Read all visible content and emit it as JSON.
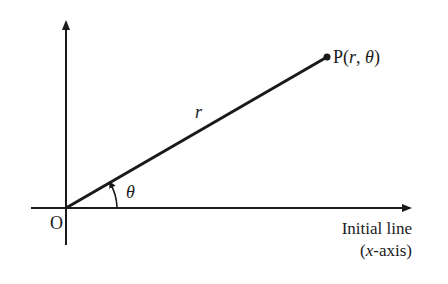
{
  "diagram": {
    "type": "polar-coordinates",
    "labels": {
      "origin": "O",
      "point_prefix": "P(",
      "point_r": "r",
      "point_sep": ", ",
      "point_theta": "θ",
      "point_suffix": ")",
      "radius": "r",
      "angle": "θ",
      "axis_line1": "Initial line",
      "axis_line2_open": "(",
      "axis_line2_var": "x",
      "axis_line2_rest": "-axis)"
    },
    "colors": {
      "stroke": "#1a1a1a",
      "background": "#ffffff"
    }
  }
}
